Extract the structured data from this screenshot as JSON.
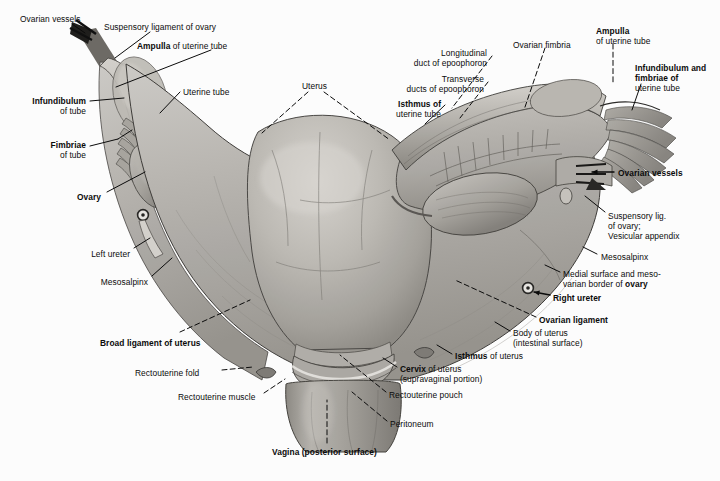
{
  "plate": {
    "title": "Uterus, uterine tubes and ovaries (posterior view)",
    "background": "#ffffff",
    "ink": "#0b0b0b",
    "width": 720,
    "height": 481
  },
  "labels": [
    {
      "id": "ovarian-vessels-left",
      "lines": [
        "Ovarian vessels"
      ],
      "bold": [
        false
      ],
      "x": 20,
      "y": 14,
      "align": "left"
    },
    {
      "id": "suspensory-ligament-of-ovary",
      "lines": [
        "Suspensory ligament of ovary"
      ],
      "bold": [
        false
      ],
      "x": 104,
      "y": 22,
      "align": "left"
    },
    {
      "id": "ampulla-of-uterine-tube-left",
      "lines": [
        "Ampulla of uterine tube"
      ],
      "bold": [
        "Ampulla"
      ],
      "x": 137,
      "y": 41,
      "align": "left"
    },
    {
      "id": "uterine-tube",
      "lines": [
        "Uterine tube"
      ],
      "bold": [
        false
      ],
      "x": 183,
      "y": 87,
      "align": "left"
    },
    {
      "id": "infundibulum-of-tube",
      "lines": [
        "Infundibulum",
        "of tube"
      ],
      "bold": [
        true,
        false
      ],
      "x": 86,
      "y": 96,
      "align": "right"
    },
    {
      "id": "fimbriae-of-tube",
      "lines": [
        "Fimbriae",
        "of tube"
      ],
      "bold": [
        true,
        false
      ],
      "x": 86,
      "y": 140,
      "align": "right"
    },
    {
      "id": "ovary-left",
      "lines": [
        "Ovary"
      ],
      "bold": [
        true
      ],
      "x": 101,
      "y": 192,
      "align": "right"
    },
    {
      "id": "left-ureter",
      "lines": [
        "Left ureter"
      ],
      "bold": [
        false
      ],
      "x": 130,
      "y": 249,
      "align": "right"
    },
    {
      "id": "mesosalpinx-left",
      "lines": [
        "Mesosalpinx"
      ],
      "bold": [
        false
      ],
      "x": 148,
      "y": 277,
      "align": "right"
    },
    {
      "id": "broad-ligament-of-uterus",
      "lines": [
        "Broad ligament of uterus"
      ],
      "bold": [
        true
      ],
      "x": 100,
      "y": 338,
      "align": "left"
    },
    {
      "id": "rectouterine-fold",
      "lines": [
        "Rectouterine fold"
      ],
      "bold": [
        false
      ],
      "x": 135,
      "y": 368,
      "align": "left"
    },
    {
      "id": "rectouterine-muscle",
      "lines": [
        "Rectouterine muscle"
      ],
      "bold": [
        false
      ],
      "x": 178,
      "y": 392,
      "align": "left"
    },
    {
      "id": "uterus",
      "lines": [
        "Uterus"
      ],
      "bold": [
        false
      ],
      "x": 302,
      "y": 81,
      "align": "left"
    },
    {
      "id": "longitudinal-duct-of-epoophoron",
      "lines": [
        "Longitudinal",
        "duct of epoophoron"
      ],
      "bold": [
        false,
        false
      ],
      "x": 487,
      "y": 48,
      "align": "right"
    },
    {
      "id": "transverse-ducts-of-epoophoron",
      "lines": [
        "Transverse",
        "ducts of epoophoron"
      ],
      "bold": [
        false,
        false
      ],
      "x": 484,
      "y": 74,
      "align": "right"
    },
    {
      "id": "isthmus-of-uterine-tube",
      "lines": [
        "Isthmus of",
        "uterine tube"
      ],
      "bold": [
        true,
        false
      ],
      "x": 441,
      "y": 99,
      "align": "right"
    },
    {
      "id": "ovarian-fimbria",
      "lines": [
        "Ovarian fimbria"
      ],
      "bold": [
        false
      ],
      "x": 513,
      "y": 40,
      "align": "left"
    },
    {
      "id": "ampulla-of-uterine-tube-right",
      "lines": [
        "Ampulla",
        "of uterine tube"
      ],
      "bold": [
        true,
        false
      ],
      "x": 596,
      "y": 26,
      "align": "left"
    },
    {
      "id": "infundibulum-and-fimbriae-of-uterine-tube",
      "lines": [
        "Infundibulum and",
        "fimbriae of",
        "uterine tube"
      ],
      "bold": [
        true,
        true,
        false
      ],
      "x": 635,
      "y": 63,
      "align": "left"
    },
    {
      "id": "ovarian-vessels-right",
      "lines": [
        "Ovarian vessels"
      ],
      "bold": [
        true
      ],
      "x": 618,
      "y": 168,
      "align": "left"
    },
    {
      "id": "suspensory-lig-vesicular-appendix",
      "lines": [
        "Suspensory lig.",
        "of ovary;",
        "Vesicular appendix"
      ],
      "bold": [
        false,
        false,
        false
      ],
      "x": 608,
      "y": 211,
      "align": "left"
    },
    {
      "id": "mesosalpinx-right",
      "lines": [
        "Mesosalpinx"
      ],
      "bold": [
        false
      ],
      "x": 601,
      "y": 252,
      "align": "left"
    },
    {
      "id": "medial-surface-mesovarian-border-of-ovary",
      "lines": [
        "Medial surface and meso-",
        "varian border of ovary"
      ],
      "bold": [
        false,
        "ovary"
      ],
      "x": 563,
      "y": 269,
      "align": "left"
    },
    {
      "id": "right-ureter",
      "lines": [
        "Right ureter"
      ],
      "bold": [
        true
      ],
      "x": 553,
      "y": 293,
      "align": "left"
    },
    {
      "id": "ovarian-ligament",
      "lines": [
        "Ovarian ligament"
      ],
      "bold": [
        true
      ],
      "x": 539,
      "y": 315,
      "align": "left"
    },
    {
      "id": "body-of-uterus",
      "lines": [
        "Body of uterus",
        "(intestinal surface)"
      ],
      "bold": [
        false,
        false
      ],
      "x": 513,
      "y": 328,
      "align": "left"
    },
    {
      "id": "isthmus-of-uterus",
      "lines": [
        "Isthmus of uterus"
      ],
      "bold": [
        "Isthmus"
      ],
      "x": 455,
      "y": 351,
      "align": "left"
    },
    {
      "id": "cervix-of-uterus",
      "lines": [
        "Cervix of uterus",
        "(supravaginal portion)"
      ],
      "bold": [
        "Cervix",
        false
      ],
      "x": 400,
      "y": 364,
      "align": "left"
    },
    {
      "id": "rectouterine-pouch",
      "lines": [
        "Rectouterine pouch"
      ],
      "bold": [
        false
      ],
      "x": 389,
      "y": 390,
      "align": "left"
    },
    {
      "id": "peritoneum",
      "lines": [
        "Peritoneum"
      ],
      "bold": [
        false
      ],
      "x": 390,
      "y": 419,
      "align": "left"
    },
    {
      "id": "vagina-posterior-surface",
      "lines": [
        "Vagina (posterior surface)"
      ],
      "bold": [
        true
      ],
      "x": 272,
      "y": 447,
      "align": "left"
    }
  ],
  "leaders": [
    {
      "id": "leader-ovarian-vessels-left",
      "style": "solid",
      "points": "72,24 85,33"
    },
    {
      "id": "leader-suspensory-ligament",
      "style": "solid",
      "points": "150,32 115,58"
    },
    {
      "id": "leader-ampulla-left",
      "style": "solid",
      "points": "211,50 116,87"
    },
    {
      "id": "leader-uterine-tube",
      "style": "solid",
      "points": "180,92 160,113"
    },
    {
      "id": "leader-infundibulum-of-tube",
      "style": "solid",
      "points": "90,101 124,98"
    },
    {
      "id": "leader-fimbriae-of-tube",
      "style": "solid",
      "points": "90,146 118,139"
    },
    {
      "id": "leader-fimbriae-of-tube-b",
      "style": "solid",
      "points": "118,139 132,130"
    },
    {
      "id": "leader-ovary-left",
      "style": "solid",
      "points": "107,192 145,172"
    },
    {
      "id": "leader-left-ureter",
      "style": "solid",
      "points": "134,248 150,238"
    },
    {
      "id": "leader-mesosalpinx-left",
      "style": "solid",
      "points": "152,276 172,258"
    },
    {
      "id": "leader-broad-ligament",
      "style": "dashed",
      "points": "180,332 250,300"
    },
    {
      "id": "leader-rectouterine-fold",
      "style": "dashed",
      "points": "222,370 253,367"
    },
    {
      "id": "leader-rectouterine-muscle",
      "style": "dashed",
      "points": "264,393 285,379"
    },
    {
      "id": "leader-uterus-a",
      "style": "dashed",
      "points": "308,92 262,133"
    },
    {
      "id": "leader-uterus-b",
      "style": "dashed",
      "points": "324,92 390,140"
    },
    {
      "id": "leader-longitudinal-duct",
      "style": "dashed",
      "points": "492,56 452,108"
    },
    {
      "id": "leader-transverse-ducts",
      "style": "dashed",
      "points": "488,82 460,118"
    },
    {
      "id": "leader-isthmus-uterine-tube",
      "style": "solid",
      "points": "445,105 425,124"
    },
    {
      "id": "leader-ovarian-fimbria",
      "style": "dashed",
      "points": "545,48 524,110"
    },
    {
      "id": "leader-ampulla-right",
      "style": "dashed",
      "points": "613,44 613,85"
    },
    {
      "id": "leader-infundibulum-right",
      "style": "solid",
      "points": "641,84 632,110"
    },
    {
      "id": "leader-ovarian-vessels-right",
      "style": "arrow",
      "points": "614,172 592,172"
    },
    {
      "id": "leader-suspensory-lig-right",
      "style": "solid",
      "points": "605,212 585,196"
    },
    {
      "id": "leader-mesosalpinx-right",
      "style": "solid",
      "points": "597,254 583,247"
    },
    {
      "id": "leader-medial-surface",
      "style": "solid",
      "points": "560,272 545,265"
    },
    {
      "id": "leader-right-ureter",
      "style": "arrow",
      "points": "550,295 534,292"
    },
    {
      "id": "leader-ovarian-ligament",
      "style": "dashed",
      "points": "536,317 455,280"
    },
    {
      "id": "leader-body-of-uterus",
      "style": "solid",
      "points": "510,331 495,322"
    },
    {
      "id": "leader-isthmus-of-uterus",
      "style": "solid",
      "points": "452,354 437,345"
    },
    {
      "id": "leader-cervix-of-uterus",
      "style": "solid",
      "points": "397,367 383,358"
    },
    {
      "id": "leader-rectouterine-pouch",
      "style": "dashed",
      "points": "386,392 340,355"
    },
    {
      "id": "leader-peritoneum",
      "style": "dashed",
      "points": "387,421 352,392"
    },
    {
      "id": "leader-vagina",
      "style": "dashed",
      "points": "327,443 327,400"
    }
  ]
}
